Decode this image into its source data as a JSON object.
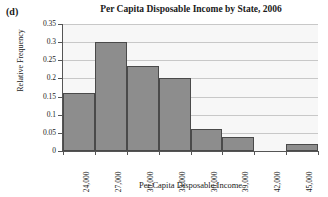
{
  "panel": {
    "letter": "(d)"
  },
  "chart_data": {
    "type": "bar",
    "title": "Per Capita Disposable Income by State, 2006",
    "xlabel": "Per Capita Disposable Income",
    "ylabel": "Relative Frequency",
    "grid": true,
    "legend": null,
    "ylim": [
      0,
      0.35
    ],
    "ytick_labels": [
      "0",
      "0.05",
      "0.1",
      "0.15",
      "0.2",
      "0.25",
      "0.3",
      "0.35"
    ],
    "ytick_values": [
      0,
      0.05,
      0.1,
      0.15,
      0.2,
      0.25,
      0.3,
      0.35
    ],
    "xtick_labels": [
      "24,000",
      "27,000",
      "30,000",
      "33,000",
      "36,000",
      "39,000",
      "42,000",
      "45,000",
      "48,000"
    ],
    "xtick_values": [
      24000,
      27000,
      30000,
      33000,
      36000,
      39000,
      42000,
      45000,
      48000
    ],
    "bin_edges": [
      24000,
      27000,
      30000,
      33000,
      36000,
      39000,
      42000,
      45000,
      48000
    ],
    "categories": [
      "24,000-27,000",
      "27,000-30,000",
      "30,000-33,000",
      "33,000-36,000",
      "36,000-39,000",
      "39,000-42,000",
      "42,000-45,000",
      "45,000-48,000"
    ],
    "values": [
      0.16,
      0.3,
      0.235,
      0.2,
      0.06,
      0.04,
      0,
      0.02
    ],
    "bar_color": "#8d8d8d",
    "bar_edge_color": "#4a4a4a",
    "plot_background": "#f7f7f7",
    "gridline_color": "#c8c8c8"
  }
}
